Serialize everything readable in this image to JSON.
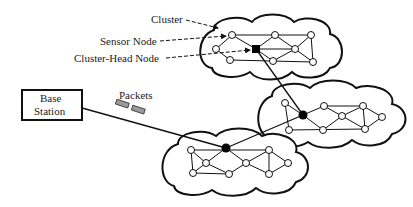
{
  "labels": {
    "cluster": "Cluster",
    "sensor_node": "Sensor Node",
    "cluster_head_node": "Cluster-Head Node",
    "base_station_line1": "Base",
    "base_station_line2": "Station",
    "packets": "Packets"
  },
  "colors": {
    "stroke": "#111111",
    "node_fill": "#ffffff",
    "head_fill": "#000000",
    "packet_fill": "#9a9a9a"
  },
  "clusters": [
    {
      "name": "top",
      "head": [
        256,
        49
      ]
    },
    {
      "name": "right",
      "head": [
        303,
        115
      ]
    },
    {
      "name": "bottom",
      "head": [
        226,
        148
      ]
    }
  ]
}
